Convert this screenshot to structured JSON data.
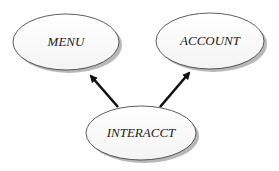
{
  "diagram": {
    "nodes": [
      {
        "id": "menu",
        "label": "MENU"
      },
      {
        "id": "account",
        "label": "ACCOUNT"
      },
      {
        "id": "interacct",
        "label": "INTERACCT"
      }
    ],
    "edges": [
      {
        "from": "interacct",
        "to": "menu"
      },
      {
        "from": "interacct",
        "to": "account"
      }
    ]
  }
}
